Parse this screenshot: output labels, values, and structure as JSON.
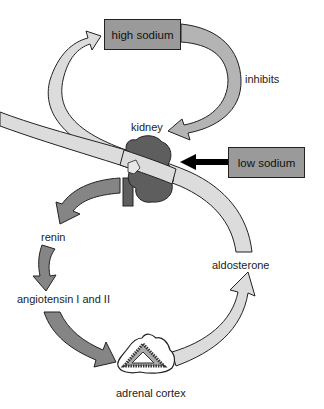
{
  "diagram": {
    "type": "feedback-loop",
    "nodes": {
      "high_sodium": "high sodium",
      "low_sodium": "low sodium",
      "kidney": "kidney",
      "renin": "renin",
      "angiotensin": "angiotensin I and II",
      "adrenal_cortex": "adrenal cortex",
      "aldosterone": "aldosterone"
    },
    "edge_labels": {
      "inhibits": "inhibits"
    },
    "edges": [
      {
        "from": "high sodium",
        "to": "kidney",
        "label": "inhibits"
      },
      {
        "from": "low sodium",
        "to": "kidney",
        "label": ""
      },
      {
        "from": "kidney",
        "to": "renin",
        "label": ""
      },
      {
        "from": "renin",
        "to": "angiotensin I and II",
        "label": ""
      },
      {
        "from": "angiotensin I and II",
        "to": "adrenal cortex",
        "label": ""
      },
      {
        "from": "adrenal cortex",
        "to": "aldosterone",
        "label": ""
      },
      {
        "from": "aldosterone",
        "to": "kidney",
        "label": ""
      },
      {
        "from": "kidney",
        "to": "high sodium",
        "label": ""
      }
    ],
    "colors": {
      "box_fill": "#9a9a9a",
      "light_arrow": "#dcdcdc",
      "medium_arrow": "#b4b4b4",
      "dark_arrow": "#858585",
      "kidney": "#5e5e5e",
      "black_arrow": "#000000"
    }
  }
}
